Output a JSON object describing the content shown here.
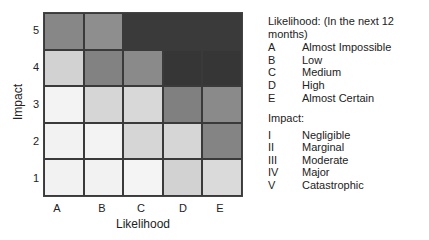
{
  "matrix": {
    "x_axis_title": "Likelihood",
    "y_axis_title": "Impact",
    "columns": [
      "A",
      "B",
      "C",
      "D",
      "E"
    ],
    "rows": [
      "5",
      "4",
      "3",
      "2",
      "1"
    ],
    "shade_colors": {
      "very_light": "#f1f1f1",
      "light": "#d4d4d4",
      "medium": "#8c8c8c",
      "medium_dark": "#7a7a7a",
      "dark": "#3a3a3a"
    },
    "cells": [
      [
        "#878787",
        "#8e8e8e",
        "#3a3a3a",
        "#3a3a3a",
        "#3a3a3a"
      ],
      [
        "#d2d2d2",
        "#828282",
        "#8a8a8a",
        "#363636",
        "#363636"
      ],
      [
        "#f3f3f3",
        "#d6d6d6",
        "#d8d8d8",
        "#808080",
        "#8a8a8a"
      ],
      [
        "#f2f2f2",
        "#f3f3f3",
        "#d6d6d6",
        "#d6d6d6",
        "#848484"
      ],
      [
        "#f2f2f2",
        "#f2f2f2",
        "#f4f4f4",
        "#d2d2d2",
        "#dadada"
      ]
    ]
  },
  "legend": {
    "likelihood": {
      "title": "Likelihood: (In the next 12 months)",
      "items": [
        {
          "key": "A",
          "label": "Almost Impossible"
        },
        {
          "key": "B",
          "label": "Low"
        },
        {
          "key": "C",
          "label": "Medium"
        },
        {
          "key": "D",
          "label": "High"
        },
        {
          "key": "E",
          "label": "Almost Certain"
        }
      ]
    },
    "impact": {
      "title": "Impact:",
      "items": [
        {
          "key": "I",
          "label": "Negligible"
        },
        {
          "key": "II",
          "label": "Marginal"
        },
        {
          "key": "III",
          "label": "Moderate"
        },
        {
          "key": "IV",
          "label": "Major"
        },
        {
          "key": "V",
          "label": "Catastrophic"
        }
      ]
    }
  }
}
